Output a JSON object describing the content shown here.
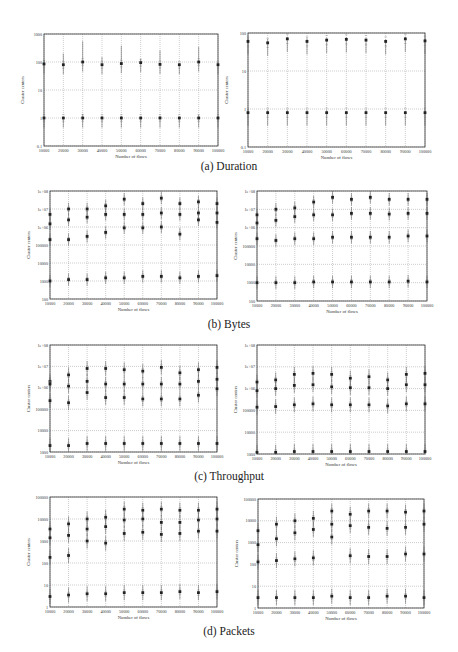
{
  "figure": {
    "captions": [
      "(a) Duration",
      "(b) Bytes",
      "(c) Throughput",
      "(d) Packets"
    ]
  },
  "chart_data": [
    {
      "id": "a-left",
      "type": "scatter",
      "title": "",
      "caption": "(a) Duration",
      "xlabel": "Number of flows",
      "ylabel": "Cluster centers",
      "yscale": "log",
      "ylim": [
        0.1,
        1000
      ],
      "grid": true,
      "x": [
        10000,
        20000,
        30000,
        40000,
        50000,
        60000,
        70000,
        80000,
        90000,
        100000
      ],
      "xticks": [
        "10000",
        "20000",
        "30000",
        "40000",
        "50000",
        "60000",
        "70000",
        "80000",
        "90000",
        "100000"
      ],
      "yticks": [
        "0.1",
        "1",
        "10",
        "100",
        "1000"
      ],
      "series": [
        {
          "name": "high cluster",
          "values": [
            85,
            80,
            100,
            80,
            88,
            95,
            82,
            80,
            100,
            80
          ],
          "upper": [
            120,
            200,
            550,
            150,
            380,
            130,
            260,
            90,
            350,
            100
          ]
        },
        {
          "name": "low cluster",
          "values": [
            1,
            1,
            1,
            1,
            1,
            1,
            1,
            1,
            1,
            1
          ],
          "upper": [
            1.1,
            1.1,
            1.4,
            1.2,
            1.2,
            1.1,
            1.2,
            1.1,
            1.3,
            1.1
          ]
        }
      ]
    },
    {
      "id": "a-right",
      "type": "scatter",
      "title": "",
      "caption": "(a) Duration",
      "xlabel": "Number of flows",
      "ylabel": "Cluster centers",
      "yscale": "log",
      "ylim": [
        0.1,
        100
      ],
      "grid": true,
      "x": [
        10000,
        20000,
        30000,
        40000,
        50000,
        60000,
        70000,
        80000,
        90000,
        100000
      ],
      "xticks": [
        "10000",
        "20000",
        "30000",
        "40000",
        "50000",
        "60000",
        "70000",
        "80000",
        "90000",
        "100000"
      ],
      "yticks": [
        "0.1",
        "1",
        "10",
        "100"
      ],
      "series": [
        {
          "name": "high cluster",
          "values": [
            60,
            55,
            70,
            60,
            65,
            68,
            65,
            60,
            70,
            62
          ],
          "upper": [
            75,
            70,
            80,
            75,
            75,
            78,
            75,
            68,
            80,
            72
          ]
        },
        {
          "name": "low cluster",
          "values": [
            0.8,
            0.8,
            0.8,
            0.8,
            0.8,
            0.8,
            0.8,
            0.8,
            0.8,
            0.8
          ],
          "upper": [
            1,
            0.95,
            0.95,
            0.95,
            0.95,
            0.9,
            0.95,
            0.9,
            0.9,
            0.95
          ]
        }
      ]
    },
    {
      "id": "b-left",
      "type": "scatter",
      "title": "",
      "caption": "(b) Bytes",
      "xlabel": "Number of flows",
      "ylabel": "Cluster centers",
      "yscale": "log",
      "ylim": [
        100,
        100000000
      ],
      "grid": true,
      "x": [
        10000,
        20000,
        30000,
        40000,
        50000,
        60000,
        70000,
        80000,
        90000,
        100000
      ],
      "xticks": [
        "10000",
        "20000",
        "30000",
        "40000",
        "50000",
        "60000",
        "70000",
        "80000",
        "90000",
        "100000"
      ],
      "yticks": [
        "100",
        "1000",
        "10000",
        "100000",
        "1e+06",
        "1e+07",
        "1e+08"
      ],
      "series": [
        {
          "name": "cluster 1",
          "values": [
            5000000,
            10000000,
            10000000,
            15000000,
            35000000,
            20000000,
            40000000,
            20000000,
            25000000,
            20000000
          ]
        },
        {
          "name": "cluster 2",
          "values": [
            1500000,
            2500000,
            3500000,
            5000000,
            5000000,
            5000000,
            6000000,
            5000000,
            6000000,
            6000000
          ]
        },
        {
          "name": "cluster 3",
          "values": [
            200000,
            200000,
            300000,
            500000,
            900000,
            900000,
            1000000,
            400000,
            2500000,
            1800000
          ]
        },
        {
          "name": "cluster 4",
          "values": [
            1000,
            1200,
            1200,
            1500,
            1500,
            1800,
            1800,
            1500,
            1800,
            2000
          ]
        }
      ]
    },
    {
      "id": "b-right",
      "type": "scatter",
      "title": "",
      "caption": "(b) Bytes",
      "xlabel": "Number of flows",
      "ylabel": "Cluster centers",
      "yscale": "log",
      "ylim": [
        100,
        100000000
      ],
      "grid": true,
      "x": [
        10000,
        20000,
        30000,
        40000,
        50000,
        60000,
        70000,
        80000,
        90000,
        100000
      ],
      "xticks": [
        "10000",
        "20000",
        "30000",
        "40000",
        "50000",
        "60000",
        "70000",
        "80000",
        "90000",
        "100000"
      ],
      "yticks": [
        "100",
        "1000",
        "10000",
        "100000",
        "1e+06",
        "1e+07",
        "1e+08"
      ],
      "series": [
        {
          "name": "cluster 1",
          "values": [
            5000000,
            10000000,
            12000000,
            25000000,
            45000000,
            35000000,
            45000000,
            35000000,
            35000000,
            35000000
          ]
        },
        {
          "name": "cluster 2",
          "values": [
            1800000,
            2500000,
            4000000,
            5000000,
            5000000,
            6000000,
            6000000,
            5500000,
            6000000,
            6000000
          ]
        },
        {
          "name": "cluster 3",
          "values": [
            250000,
            200000,
            250000,
            250000,
            300000,
            300000,
            300000,
            300000,
            350000,
            350000
          ]
        },
        {
          "name": "cluster 4",
          "values": [
            1000,
            1000,
            1000,
            1100,
            1100,
            1100,
            1100,
            1100,
            1200,
            1100
          ]
        }
      ]
    },
    {
      "id": "c-left",
      "type": "scatter",
      "title": "",
      "caption": "(c) Throughput",
      "xlabel": "Number of flows",
      "ylabel": "Cluster centers",
      "yscale": "log",
      "ylim": [
        1000,
        100000000
      ],
      "grid": true,
      "x": [
        10000,
        20000,
        30000,
        40000,
        50000,
        60000,
        70000,
        80000,
        90000,
        100000
      ],
      "xticks": [
        "10000",
        "20000",
        "30000",
        "40000",
        "50000",
        "60000",
        "70000",
        "80000",
        "90000",
        "100000"
      ],
      "yticks": [
        "1000",
        "10000",
        "100000",
        "1e+06",
        "1e+07",
        "1e+08"
      ],
      "series": [
        {
          "name": "cluster 1",
          "values": [
            2000000,
            4000000,
            8000000,
            8000000,
            7000000,
            6000000,
            9000000,
            5000000,
            7000000,
            9000000
          ]
        },
        {
          "name": "cluster 2",
          "values": [
            1500000,
            1200000,
            2000000,
            1500000,
            1500000,
            1500000,
            1500000,
            1500000,
            2000000,
            2500000
          ]
        },
        {
          "name": "cluster 3",
          "values": [
            250000,
            200000,
            600000,
            350000,
            350000,
            300000,
            300000,
            300000,
            450000,
            900000
          ]
        },
        {
          "name": "cluster 4",
          "values": [
            2000,
            2000,
            2500,
            2500,
            2500,
            2500,
            2500,
            2500,
            2500,
            2500
          ]
        }
      ]
    },
    {
      "id": "c-right",
      "type": "scatter",
      "title": "",
      "caption": "(c) Throughput",
      "xlabel": "Number of flows",
      "ylabel": "Cluster centers",
      "yscale": "log",
      "ylim": [
        1000,
        100000000
      ],
      "grid": true,
      "x": [
        10000,
        20000,
        30000,
        40000,
        50000,
        60000,
        70000,
        80000,
        90000,
        100000
      ],
      "xticks": [
        "10000",
        "20000",
        "30000",
        "40000",
        "50000",
        "60000",
        "70000",
        "80000",
        "90000",
        "100000"
      ],
      "yticks": [
        "1000",
        "10000",
        "100000",
        "1e+06",
        "1e+07",
        "1e+08"
      ],
      "series": [
        {
          "name": "cluster 1",
          "values": [
            2000000,
            2500000,
            4500000,
            5000000,
            4500000,
            3000000,
            3500000,
            2500000,
            4500000,
            5000000
          ]
        },
        {
          "name": "cluster 2",
          "values": [
            800000,
            1000000,
            1400000,
            1500000,
            1200000,
            1100000,
            1100000,
            1000000,
            1500000,
            1500000
          ]
        },
        {
          "name": "cluster 3",
          "values": [
            140000,
            150000,
            180000,
            200000,
            180000,
            180000,
            180000,
            160000,
            200000,
            200000
          ]
        },
        {
          "name": "cluster 4",
          "values": [
            1200,
            1200,
            1300,
            1300,
            1300,
            1300,
            1300,
            1300,
            1300,
            1300
          ]
        }
      ]
    },
    {
      "id": "d-left",
      "type": "scatter",
      "title": "",
      "caption": "(d) Packets",
      "xlabel": "Number of flows",
      "ylabel": "Cluster centers",
      "yscale": "log",
      "ylim": [
        1,
        100000
      ],
      "grid": true,
      "x": [
        10000,
        20000,
        30000,
        40000,
        50000,
        60000,
        70000,
        80000,
        90000,
        100000
      ],
      "xticks": [
        "10000",
        "20000",
        "30000",
        "40000",
        "50000",
        "60000",
        "70000",
        "80000",
        "90000",
        "100000"
      ],
      "yticks": [
        "1",
        "10",
        "100",
        "1000",
        "10000",
        "100000"
      ],
      "series": [
        {
          "name": "cluster 1",
          "values": [
            3500,
            6000,
            10000,
            12000,
            28000,
            25000,
            28000,
            25000,
            25000,
            28000
          ]
        },
        {
          "name": "cluster 2",
          "values": [
            1400,
            1800,
            3500,
            4500,
            9000,
            10000,
            7000,
            7000,
            9000,
            10000
          ]
        },
        {
          "name": "cluster 3",
          "values": [
            180,
            220,
            1000,
            800,
            2200,
            2500,
            2000,
            2200,
            2800,
            2800
          ]
        },
        {
          "name": "cluster 4",
          "values": [
            3,
            3.5,
            4,
            4,
            4.5,
            4.5,
            4.5,
            5,
            4.5,
            5
          ]
        }
      ]
    },
    {
      "id": "d-right",
      "type": "scatter",
      "title": "",
      "caption": "(d) Packets",
      "xlabel": "Number of flows",
      "ylabel": "Cluster centers",
      "yscale": "log",
      "ylim": [
        1,
        100000
      ],
      "grid": true,
      "x": [
        10000,
        20000,
        30000,
        40000,
        50000,
        60000,
        70000,
        80000,
        90000,
        100000
      ],
      "xticks": [
        "10000",
        "20000",
        "30000",
        "40000",
        "50000",
        "60000",
        "70000",
        "80000",
        "90000",
        "100000"
      ],
      "yticks": [
        "1",
        "10",
        "100",
        "1000",
        "10000",
        "100000"
      ],
      "series": [
        {
          "name": "cluster 1",
          "values": [
            3500,
            7000,
            10000,
            13000,
            28000,
            20000,
            28000,
            28000,
            25000,
            28000
          ]
        },
        {
          "name": "cluster 2",
          "values": [
            800,
            1500,
            2800,
            4000,
            7000,
            6000,
            5000,
            4500,
            5000,
            7000
          ]
        },
        {
          "name": "cluster 3",
          "values": [
            130,
            150,
            180,
            200,
            1800,
            250,
            230,
            230,
            300,
            300
          ]
        },
        {
          "name": "cluster 4",
          "values": [
            3,
            3,
            3,
            3,
            3.5,
            3,
            3,
            3.5,
            3.5,
            3
          ]
        }
      ]
    }
  ]
}
